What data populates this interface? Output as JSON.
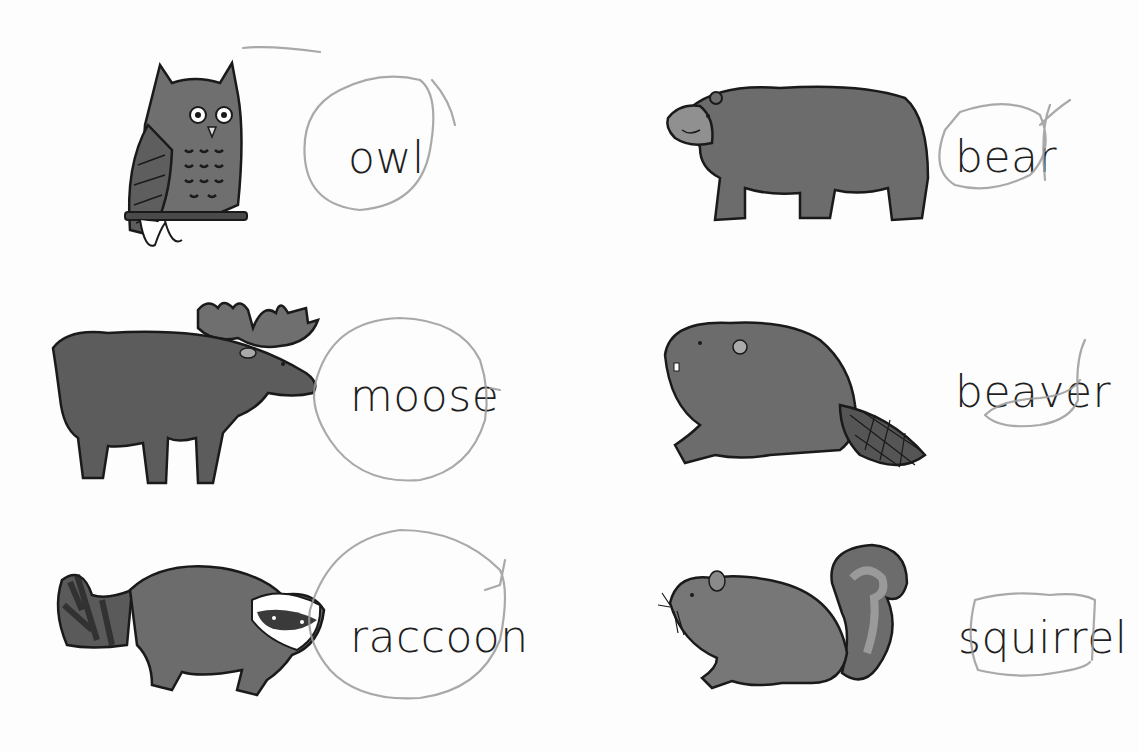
{
  "worksheet": {
    "animals": [
      {
        "id": "owl",
        "label": "owl",
        "illustration": "owl-illustration",
        "column": "left",
        "row": 1
      },
      {
        "id": "bear",
        "label": "bear",
        "illustration": "bear-illustration",
        "column": "right",
        "row": 1
      },
      {
        "id": "moose",
        "label": "moose",
        "illustration": "moose-illustration",
        "column": "left",
        "row": 2
      },
      {
        "id": "beaver",
        "label": "beaver",
        "illustration": "beaver-illustration",
        "column": "right",
        "row": 2
      },
      {
        "id": "raccoon",
        "label": "raccoon",
        "illustration": "raccoon-illustration",
        "column": "left",
        "row": 3
      },
      {
        "id": "squirrel",
        "label": "squirrel",
        "illustration": "squirrel-illustration",
        "column": "right",
        "row": 3
      }
    ],
    "annotations": {
      "type": "hand-drawn pencil circles around words",
      "color": "#9a9a9a"
    },
    "colors": {
      "fur_dark": "#5e5e5e",
      "fur_mid": "#6f6f6f",
      "fur_light": "#8a8a8a",
      "outline": "#1a1a1a",
      "text": "#1f1f1f"
    }
  }
}
